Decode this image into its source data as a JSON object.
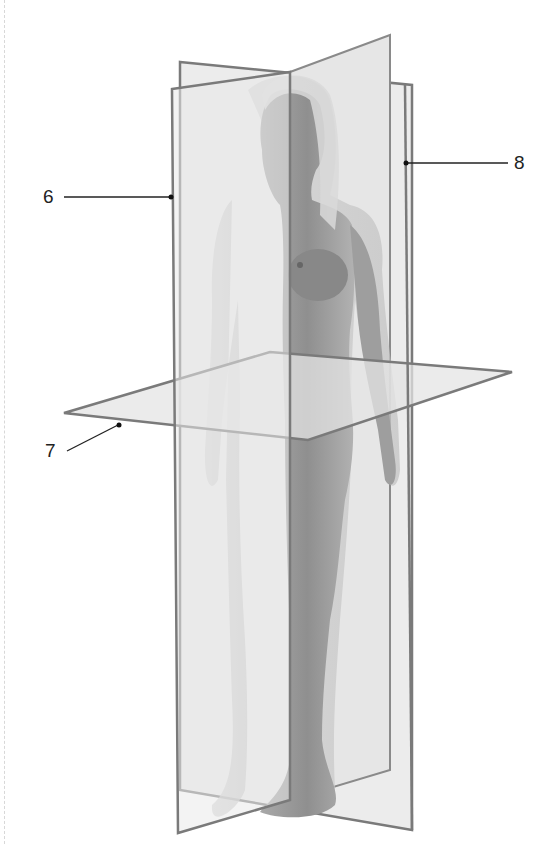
{
  "figure": {
    "planes": [
      {
        "id": "sagittal",
        "label_number": "6"
      },
      {
        "id": "transverse",
        "label_number": "7"
      },
      {
        "id": "frontal",
        "label_number": "8"
      }
    ]
  },
  "labels": {
    "six": "6",
    "seven": "7",
    "eight": "8"
  },
  "colors": {
    "plane_fill": "#e8e8e8",
    "plane_edge": "#7a7a7a",
    "skin_dark": "#8c8c8c",
    "skin_light": "#c4c4c4",
    "leader": "#222222"
  }
}
